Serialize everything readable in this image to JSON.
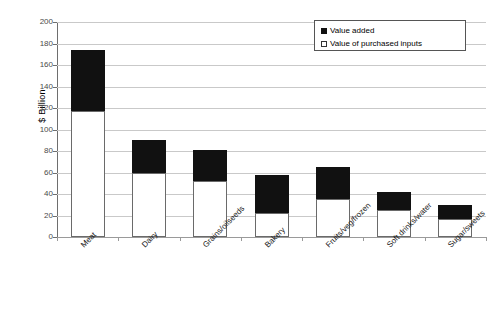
{
  "chart_data": {
    "type": "bar",
    "subtype": "stacked-vertical",
    "title": "",
    "xlabel": "",
    "ylabel": "$ Billion",
    "ylim": [
      0,
      200
    ],
    "ytick_step": 20,
    "yticks": [
      0,
      20,
      40,
      60,
      80,
      100,
      120,
      140,
      160,
      180,
      200
    ],
    "ytick_labels": [
      "0",
      "20",
      "40",
      "60",
      "80",
      "100",
      "120",
      "140",
      "160",
      "180",
      "200"
    ],
    "grid": "horizontal",
    "legend_position": "upper-right-inside",
    "categories": [
      "Meat",
      "Dairy",
      "Grains/oilseeds",
      "Bakery",
      "Fruits/veg/frozen",
      "Soft drinks/water",
      "Sugar/sweets"
    ],
    "series": [
      {
        "name": "Value of purchased inputs",
        "color": "#ffffff",
        "edge_color": "#6a6a6a",
        "values": [
          117,
          60,
          52,
          22,
          35,
          25,
          17
        ]
      },
      {
        "name": "Value added",
        "color": "#111111",
        "edge_color": "#111111",
        "values": [
          57,
          30,
          29,
          36,
          30,
          17,
          13
        ]
      }
    ],
    "totals": [
      174,
      90,
      81,
      58,
      65,
      42,
      30
    ]
  },
  "legend": {
    "items": [
      {
        "label": "Value added",
        "swatch": "filled-square"
      },
      {
        "label": "Value of purchased inputs",
        "swatch": "hollow-square"
      }
    ]
  },
  "axes": {
    "y_title": "$ Billion"
  }
}
